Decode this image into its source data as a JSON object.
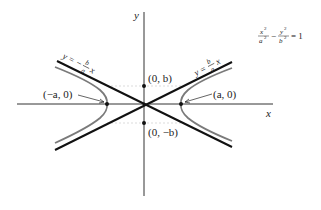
{
  "diagram": {
    "title_equation": {
      "term1_num": "x",
      "term1_num_exp": "2",
      "term1_den": "a",
      "term1_den_exp": "2",
      "minus": "−",
      "term2_num": "y",
      "term2_num_exp": "2",
      "term2_den": "b",
      "term2_den_exp": "2",
      "equals": "= 1"
    },
    "axes": {
      "x_label": "x",
      "y_label": "y"
    },
    "points": {
      "vertex_right": "(a, 0)",
      "vertex_left": "(−a, 0)",
      "co_vertex_top": "(0, b)",
      "co_vertex_bottom": "(0, −b)"
    },
    "asymptotes": {
      "positive": {
        "lhs": "y =",
        "num": "b",
        "den": "a",
        "var": "x"
      },
      "negative": {
        "lhs": "y = −",
        "num": "b",
        "den": "a",
        "var": "x"
      }
    },
    "colors": {
      "axis": "#333333",
      "asymptote": "#111111",
      "hyperbola": "#7a7a7a",
      "guide": "#bbbbbb"
    }
  }
}
